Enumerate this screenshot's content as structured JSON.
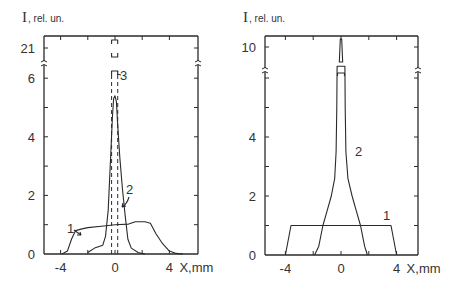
{
  "chart_data": [
    {
      "type": "line",
      "panel": "left",
      "ylabel_main": "I",
      "ylabel_unit": ", rel. un.",
      "xlabel": "X,mm",
      "xlim": [
        -5.2,
        6.1
      ],
      "ylim": [
        0,
        6.5
      ],
      "y_break": {
        "below": 6.5,
        "above_label": "21"
      },
      "x_ticks": [
        -4,
        0,
        4
      ],
      "x_tick_labels": [
        "-4",
        "0",
        "4"
      ],
      "y_ticks": [
        0,
        2,
        4,
        6
      ],
      "y_tick_labels": [
        "0",
        "2",
        "4",
        "6"
      ],
      "y_break_tick_label": "21",
      "series": [
        {
          "name": "1",
          "style": "solid",
          "x": [
            -3.9,
            -3.5,
            -3.2,
            -2.9,
            -2.5,
            -2.0,
            -1.0,
            0.0,
            1.0,
            1.5,
            2.2,
            2.6,
            3.0,
            3.5,
            4.0,
            4.5,
            5.0
          ],
          "y": [
            0.0,
            0.1,
            0.5,
            0.8,
            0.85,
            0.9,
            0.95,
            1.0,
            1.02,
            1.1,
            1.1,
            1.05,
            0.7,
            0.35,
            0.1,
            0.02,
            0.0
          ]
        },
        {
          "name": "2",
          "style": "solid",
          "x": [
            -2.0,
            -1.5,
            -0.9,
            -0.7,
            -0.5,
            -0.3,
            -0.2,
            -0.1,
            0.0,
            0.1,
            0.2,
            0.35,
            0.55,
            0.75,
            0.95,
            1.2,
            1.7,
            2.2
          ],
          "y": [
            0.05,
            0.2,
            0.3,
            0.6,
            1.5,
            3.5,
            4.6,
            5.3,
            5.4,
            5.2,
            4.4,
            3.3,
            2.2,
            1.3,
            0.5,
            0.2,
            0.05,
            0.0
          ]
        },
        {
          "name": "3",
          "style": "dashed",
          "x_left": -0.25,
          "x_right": 0.2,
          "peak_beyond_break": 21
        }
      ],
      "annotations": [
        {
          "text": "1",
          "target_series": "1"
        },
        {
          "text": "2",
          "target_series": "2"
        },
        {
          "text": "3",
          "target_series": "3"
        }
      ]
    },
    {
      "type": "line",
      "panel": "right",
      "ylabel_main": "I",
      "ylabel_unit": ", rel. un.",
      "xlabel": "X,mm",
      "xlim": [
        -5.4,
        5.6
      ],
      "ylim": [
        0,
        6.4
      ],
      "y_break": {
        "below": 6.4,
        "above_label": "10"
      },
      "x_ticks": [
        -4,
        0,
        4
      ],
      "x_tick_labels": [
        "-4",
        "0",
        "4"
      ],
      "y_ticks": [
        0,
        2,
        4
      ],
      "y_tick_labels": [
        "0",
        "2",
        "4"
      ],
      "y_break_tick_label": "10",
      "series": [
        {
          "name": "1",
          "style": "solid",
          "x": [
            -4.0,
            -3.6,
            3.6,
            4.0
          ],
          "y": [
            0.0,
            1.0,
            1.0,
            0.0
          ]
        },
        {
          "name": "2",
          "style": "solid",
          "x": [
            -1.9,
            -1.6,
            -1.3,
            -1.0,
            -0.7,
            -0.45,
            -0.35,
            -0.3,
            -0.28,
            0.28,
            0.3,
            0.35,
            0.5,
            0.8,
            1.1,
            1.4,
            1.7,
            1.9
          ],
          "y": [
            0.0,
            0.3,
            1.0,
            1.5,
            2.0,
            2.6,
            3.5,
            5.0,
            6.4,
            6.4,
            5.0,
            3.5,
            2.6,
            2.0,
            1.5,
            1.0,
            0.3,
            0.0
          ],
          "peak_beyond_break": 10
        }
      ],
      "annotations": [
        {
          "text": "1",
          "target_series": "1"
        },
        {
          "text": "2",
          "target_series": "2"
        }
      ]
    }
  ]
}
